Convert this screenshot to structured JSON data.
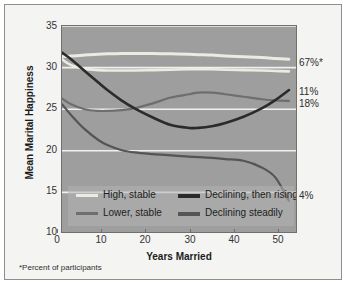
{
  "figure": {
    "y_axis_title": "Mean Marital Happiness",
    "x_axis_title": "Years Married",
    "footnote": "*Percent of participants"
  },
  "axes": {
    "y_ticks": [
      "35",
      "30",
      "25",
      "20",
      "15",
      "10"
    ],
    "x_ticks": [
      "0",
      "10",
      "20",
      "30",
      "40",
      "50"
    ]
  },
  "right_labels": [
    {
      "text": "67%*",
      "value": 67
    },
    {
      "text": "11%",
      "value": 11
    },
    {
      "text": "18%",
      "value": 18
    },
    {
      "text": "4%",
      "value": 4
    }
  ],
  "legend": {
    "items": [
      {
        "label": "High, stable",
        "color": "#eceae2"
      },
      {
        "label": "Lower, stable",
        "color": "#6e6e6e"
      },
      {
        "label": "Declining, then rising",
        "color": "#2b2b2b"
      },
      {
        "label": "Declining steadily",
        "color": "#555555"
      }
    ]
  },
  "colors": {
    "plot_background": "#9e9e9e",
    "page_background": "#f4f4f2",
    "gridline": "#f0f0ee",
    "frame_border": "#8e8e8e",
    "axis_text": "#333333"
  },
  "chart_data": {
    "type": "line",
    "title": "",
    "subtitle": "",
    "xlabel": "Years Married",
    "ylabel": "Mean Marital Happiness",
    "xlim": [
      0,
      52
    ],
    "ylim": [
      10,
      35
    ],
    "xticks": [
      0,
      10,
      20,
      30,
      40,
      50
    ],
    "yticks": [
      10,
      15,
      20,
      25,
      30,
      35
    ],
    "grid": "horizontal",
    "legend_position": "inside-bottom-left",
    "annotations": [
      {
        "text": "67%*",
        "x": 52,
        "y": 31.0
      },
      {
        "text": "11%",
        "x": 52,
        "y": 27.4
      },
      {
        "text": "18%",
        "x": 52,
        "y": 26.0
      },
      {
        "text": "4%",
        "x": 52,
        "y": 14.0
      }
    ],
    "x": [
      0,
      2,
      5,
      8,
      10,
      13,
      16,
      20,
      24,
      28,
      30,
      33,
      36,
      40,
      44,
      47,
      50
    ],
    "series": [
      {
        "name": "High, stable",
        "color": "#eceae2",
        "percent": 67,
        "values": [
          31.3,
          31.4,
          31.5,
          31.6,
          31.65,
          31.7,
          31.7,
          31.7,
          31.65,
          31.6,
          31.55,
          31.5,
          31.4,
          31.3,
          31.2,
          31.1,
          31.0
        ]
      },
      {
        "name": "High, stable (second band)",
        "color": "#eceae2",
        "percent": null,
        "values": [
          31.0,
          30.3,
          29.85,
          29.7,
          29.65,
          29.65,
          29.65,
          29.7,
          29.75,
          29.8,
          29.8,
          29.8,
          29.75,
          29.7,
          29.65,
          29.6,
          29.55
        ]
      },
      {
        "name": "Lower, stable",
        "color": "#6e6e6e",
        "percent": 18,
        "values": [
          26.3,
          25.6,
          25.0,
          24.8,
          24.8,
          24.9,
          25.1,
          25.7,
          26.4,
          26.8,
          27.0,
          27.0,
          26.8,
          26.5,
          26.2,
          26.05,
          26.0
        ]
      },
      {
        "name": "Declining, then rising",
        "color": "#2b2b2b",
        "percent": 11,
        "values": [
          31.8,
          31.0,
          29.6,
          28.2,
          27.3,
          26.1,
          25.1,
          24.0,
          23.1,
          22.75,
          22.75,
          22.95,
          23.35,
          24.1,
          25.1,
          26.1,
          27.3
        ]
      },
      {
        "name": "Declining steadily",
        "color": "#555555",
        "percent": 4,
        "values": [
          25.6,
          24.3,
          22.6,
          21.3,
          20.7,
          20.1,
          19.8,
          19.6,
          19.45,
          19.3,
          19.25,
          19.15,
          19.0,
          18.8,
          18.0,
          16.8,
          14.0
        ]
      }
    ]
  }
}
